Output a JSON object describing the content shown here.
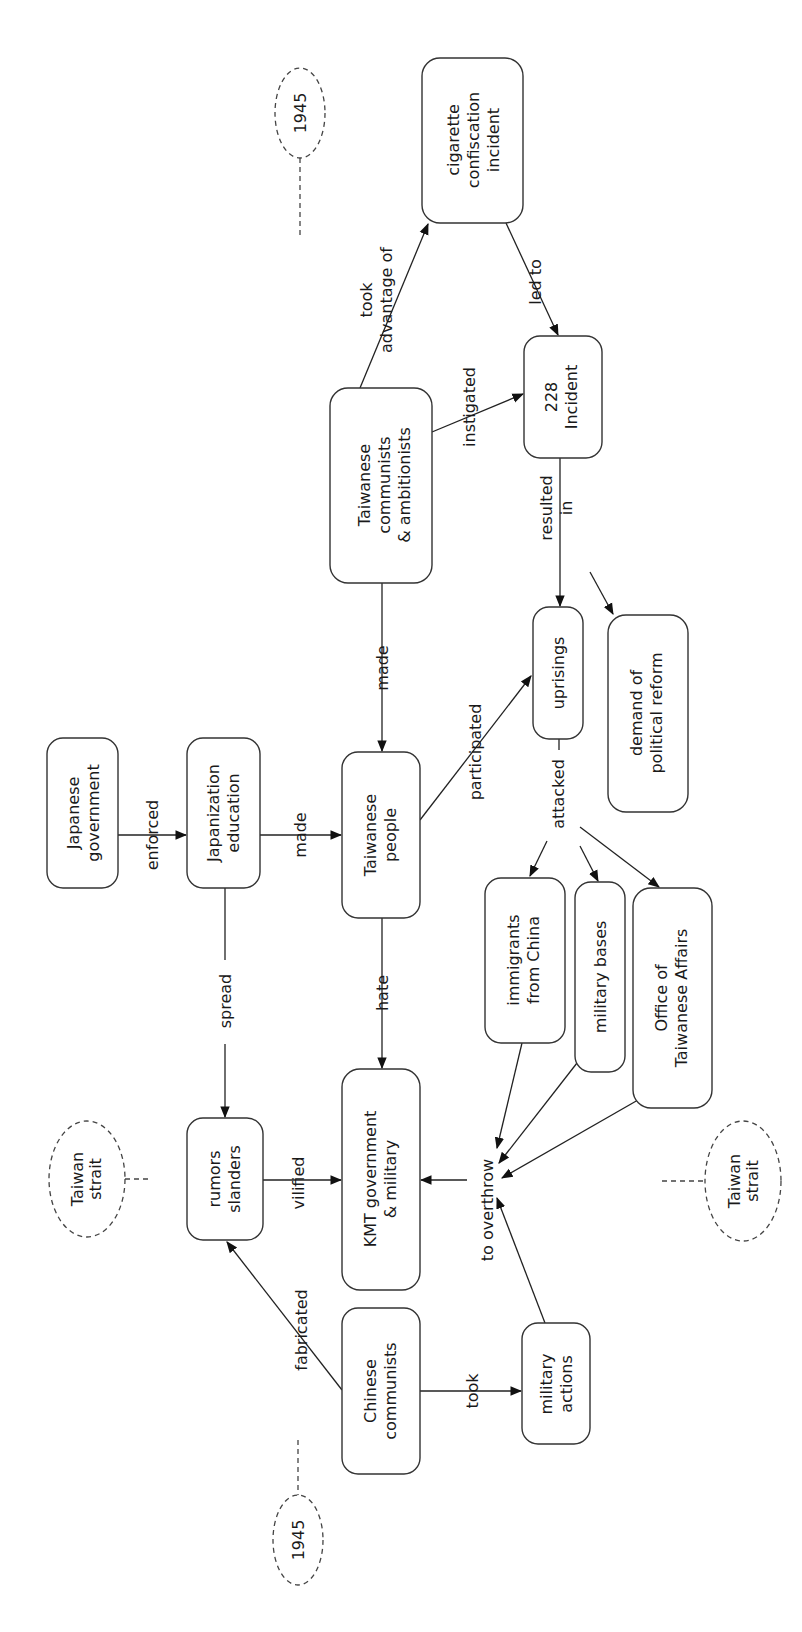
{
  "diagram": {
    "type": "concept-map",
    "orientation": "rotated-90-ccw",
    "nodes": [
      {
        "id": "japanese_government",
        "lines": [
          "Japanese",
          "government"
        ],
        "box": [
          47,
          738,
          118,
          888
        ]
      },
      {
        "id": "japanization_education",
        "lines": [
          "Japanization",
          "education"
        ],
        "box": [
          187,
          738,
          260,
          888
        ]
      },
      {
        "id": "taiwanese_people",
        "lines": [
          "Taiwanese",
          "people"
        ],
        "box": [
          342,
          752,
          420,
          918
        ]
      },
      {
        "id": "taiwanese_communists",
        "lines": [
          "Taiwanese",
          "communists",
          "& ambitionists"
        ],
        "box": [
          330,
          388,
          432,
          583
        ]
      },
      {
        "id": "cigarette_incident",
        "lines": [
          "cigarette",
          "confiscation",
          "incident"
        ],
        "box": [
          422,
          58,
          523,
          223
        ]
      },
      {
        "id": "incident_228",
        "lines": [
          "228",
          "Incident"
        ],
        "box": [
          524,
          336,
          602,
          458
        ]
      },
      {
        "id": "uprisings",
        "lines": [
          "uprisings"
        ],
        "box": [
          533,
          607,
          583,
          739
        ]
      },
      {
        "id": "demand_reform",
        "lines": [
          "demand of",
          "political reform"
        ],
        "box": [
          608,
          615,
          688,
          812
        ]
      },
      {
        "id": "immigrants",
        "lines": [
          "immigrants",
          "from China"
        ],
        "box": [
          485,
          878,
          565,
          1043
        ]
      },
      {
        "id": "military_bases",
        "lines": [
          "military bases"
        ],
        "box": [
          575,
          882,
          625,
          1072
        ]
      },
      {
        "id": "office_affairs",
        "lines": [
          "Office of",
          "Taiwanese Affairs"
        ],
        "box": [
          633,
          888,
          712,
          1108
        ]
      },
      {
        "id": "rumors",
        "lines": [
          "rumors",
          "slanders"
        ],
        "box": [
          187,
          1118,
          263,
          1240
        ]
      },
      {
        "id": "kmt",
        "lines": [
          "KMT government",
          "& military"
        ],
        "box": [
          342,
          1069,
          420,
          1290
        ]
      },
      {
        "id": "chinese_communists",
        "lines": [
          "Chinese",
          "communists"
        ],
        "box": [
          342,
          1308,
          420,
          1474
        ]
      },
      {
        "id": "military_actions",
        "lines": [
          "military",
          "actions"
        ],
        "box": [
          522,
          1323,
          590,
          1444
        ]
      }
    ],
    "links": [
      {
        "from": "japanese_government",
        "to": "japanization_education",
        "label": [
          "enforced"
        ]
      },
      {
        "from": "japanization_education",
        "to": "taiwanese_people",
        "label": [
          "made"
        ]
      },
      {
        "from": "taiwanese_communists",
        "to": "taiwanese_people",
        "label": [
          "made"
        ]
      },
      {
        "from": "taiwanese_communists",
        "to": "cigarette_incident",
        "label": [
          "took",
          "advantage of"
        ]
      },
      {
        "from": "taiwanese_communists",
        "to": "incident_228",
        "label": [
          "instigated"
        ]
      },
      {
        "from": "cigarette_incident",
        "to": "incident_228",
        "label": [
          "led to"
        ]
      },
      {
        "from": "incident_228",
        "to": "uprisings",
        "label": [
          "resulted",
          "in"
        ]
      },
      {
        "from": "incident_228",
        "to": "demand_reform",
        "label": []
      },
      {
        "from": "taiwanese_people",
        "to": "uprisings",
        "label": [
          "participated"
        ]
      },
      {
        "from": "uprisings",
        "to": [
          "immigrants",
          "military_bases",
          "office_affairs"
        ],
        "label": [
          "attacked"
        ]
      },
      {
        "from": "japanization_education",
        "to": "rumors",
        "label": [
          "spread"
        ]
      },
      {
        "from": "taiwanese_people",
        "to": "kmt",
        "label": [
          "hate"
        ]
      },
      {
        "from": "rumors",
        "to": "kmt",
        "label": [
          "vilified"
        ]
      },
      {
        "from": [
          "immigrants",
          "military_bases",
          "office_affairs",
          "military_actions"
        ],
        "to": "kmt",
        "label": [
          "to overthrow"
        ]
      },
      {
        "from": "chinese_communists",
        "to": "rumors",
        "label": [
          "fabricated"
        ]
      },
      {
        "from": "chinese_communists",
        "to": "military_actions",
        "label": [
          "took"
        ]
      }
    ],
    "annotations": [
      {
        "id": "year_top",
        "text": "1945"
      },
      {
        "id": "year_bottom",
        "text": "1945"
      },
      {
        "id": "strait_left",
        "lines": [
          "Taiwan",
          "strait"
        ]
      },
      {
        "id": "strait_right",
        "lines": [
          "Taiwan",
          "strait"
        ]
      }
    ]
  },
  "labels": {
    "japanese_government": [
      "Japanese",
      "government"
    ],
    "japanization_education": [
      "Japanization",
      "education"
    ],
    "taiwanese_people": [
      "Taiwanese",
      "people"
    ],
    "taiwanese_communists": [
      "Taiwanese",
      "communists",
      "& ambitionists"
    ],
    "cigarette_incident": [
      "cigarette",
      "confiscation",
      "incident"
    ],
    "incident_228": [
      "228",
      "Incident"
    ],
    "uprisings": [
      "uprisings"
    ],
    "demand_reform": [
      "demand of",
      "political reform"
    ],
    "immigrants": [
      "immigrants",
      "from China"
    ],
    "military_bases": [
      "military bases"
    ],
    "office_affairs": [
      "Office of",
      "Taiwanese Affairs"
    ],
    "rumors": [
      "rumors",
      "slanders"
    ],
    "kmt": [
      "KMT government",
      "& military"
    ],
    "chinese_communists": [
      "Chinese",
      "communists"
    ],
    "military_actions": [
      "military",
      "actions"
    ],
    "enforced": "enforced",
    "made_1": "made",
    "made_2": "made",
    "took_adv": [
      "took",
      "advantage of"
    ],
    "instigated": "instigated",
    "led_to": "led to",
    "resulted_in": [
      "resulted",
      "in"
    ],
    "participated": "participated",
    "attacked": "attacked",
    "spread": "spread",
    "hate": "hate",
    "vilified": "vilified",
    "to_overthrow": "to overthrow",
    "fabricated": "fabricated",
    "took": "took",
    "year_top": "1945",
    "year_bottom": "1945",
    "strait_left": [
      "Taiwan",
      "strait"
    ],
    "strait_right": [
      "Taiwan",
      "strait"
    ]
  }
}
